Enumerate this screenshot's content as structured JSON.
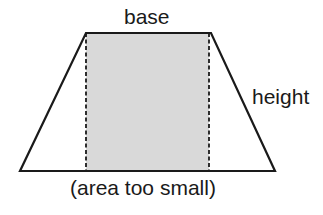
{
  "diagram": {
    "labels": {
      "top": "base",
      "side": "height",
      "caption": "(area too small)"
    },
    "shapes": {
      "trapezoid": {
        "points": [
          [
            86,
            33
          ],
          [
            211,
            33
          ],
          [
            275,
            171
          ],
          [
            20,
            171
          ]
        ],
        "stroke": "#1a1a1a",
        "fill": "none"
      },
      "rectangle": {
        "x": 86,
        "y": 33,
        "width": 123,
        "height": 138,
        "fill": "#d9d9d9",
        "side_edges": "dashed"
      }
    },
    "colors": {
      "line": "#1a1a1a",
      "shading": "#d9d9d9",
      "background": "#ffffff"
    }
  }
}
